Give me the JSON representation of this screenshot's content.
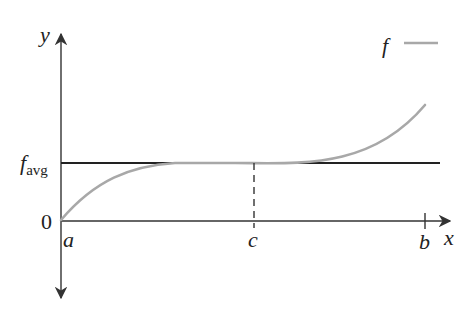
{
  "diagram": {
    "axes": {
      "x_label": "x",
      "y_label": "y"
    },
    "legend": {
      "label": "f",
      "line_color": "#a8a8a8"
    },
    "labels": {
      "f_avg_main": "f",
      "f_avg_sub": "avg",
      "origin": "0",
      "a": "a",
      "c": "c",
      "b": "b"
    },
    "colors": {
      "axis": "#333333",
      "avg_line": "#222222",
      "curve": "#a8a8a8"
    }
  }
}
